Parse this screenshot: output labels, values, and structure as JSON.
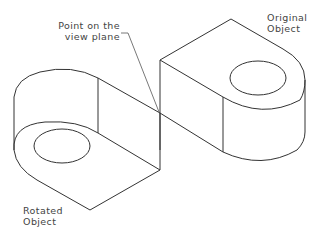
{
  "diagram": {
    "type": "isometric-technical-drawing",
    "labels": {
      "view_point": [
        "Point on the",
        "view plane"
      ],
      "original": [
        "Original",
        "Object"
      ],
      "rotated": [
        "Rotated",
        "Object"
      ]
    },
    "colors": {
      "line": "#333333",
      "leader": "#555555",
      "text": "#444444",
      "background": "#ffffff"
    }
  }
}
